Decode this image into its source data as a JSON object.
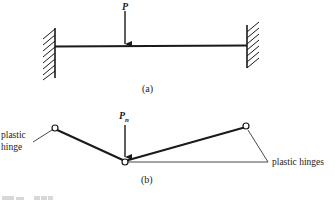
{
  "figure": {
    "part_a": {
      "load_label": "P",
      "caption": "(a)",
      "supports": [
        "fixed-left",
        "fixed-right"
      ]
    },
    "part_b": {
      "load_label": "P",
      "load_subscript": "n",
      "caption": "(b)",
      "left_label_line1": "plastic",
      "left_label_line2": "hinge",
      "right_label": "plastic hinges"
    },
    "colors": {
      "ink": "#1a1a1a",
      "background": "#ffffff"
    }
  }
}
